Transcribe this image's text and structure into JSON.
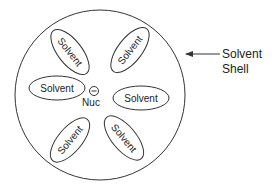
{
  "diagram": {
    "shell_label_line1": "Solvent",
    "shell_label_line2": "Shell",
    "nucleophile_label": "Nuc",
    "charge_symbol": "−",
    "solvent_molecules": [
      {
        "label": "Solvent",
        "position": "upper-left"
      },
      {
        "label": "Solvent",
        "position": "upper-right"
      },
      {
        "label": "Solvent",
        "position": "left"
      },
      {
        "label": "Solvent",
        "position": "right"
      },
      {
        "label": "Solvent",
        "position": "lower-left"
      },
      {
        "label": "Solvent",
        "position": "lower-right"
      }
    ]
  }
}
